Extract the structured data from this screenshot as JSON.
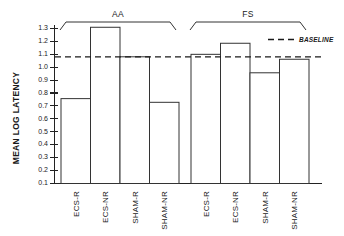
{
  "chart_data": {
    "type": "bar",
    "title": "",
    "xlabel": "",
    "ylabel": "MEAN LOG LATENCY",
    "ylim": [
      0.04,
      1.35
    ],
    "yticks": [
      "1.3",
      "1.2",
      "1.1",
      "1.0",
      "0.9",
      "0.8",
      "0.7",
      "0.6",
      "0.5",
      "0.4",
      "0.3",
      "0.2",
      "0.1"
    ],
    "ytick_values": [
      1.3,
      1.2,
      1.1,
      1.0,
      0.9,
      0.8,
      0.7,
      0.6,
      0.5,
      0.4,
      0.3,
      0.2,
      0.1
    ],
    "grid": false,
    "legend_position": "top-right",
    "groups": [
      {
        "name": "AA",
        "categories": [
          "ECS-R",
          "ECS-NR",
          "SHAM-R",
          "SHAM-NR"
        ],
        "values": [
          0.73,
          1.31,
          1.07,
          0.7
        ]
      },
      {
        "name": "FS",
        "categories": [
          "ECS-R",
          "ECS-NR",
          "SHAM-R",
          "SHAM-NR"
        ],
        "values": [
          1.09,
          1.18,
          0.94,
          1.05
        ]
      }
    ],
    "categories": [
      "ECS-R",
      "ECS-NR",
      "SHAM-R",
      "SHAM-NR",
      "ECS-R",
      "ECS-NR",
      "SHAM-R",
      "SHAM-NR"
    ],
    "values": [
      0.73,
      1.31,
      1.07,
      0.7,
      1.09,
      1.18,
      0.94,
      1.05
    ],
    "annotations": [
      {
        "name": "baseline",
        "label": "BASELINE",
        "value": 1.07,
        "style": "dashed-horizontal-line"
      }
    ],
    "colors": {
      "bar_fill": "#ffffff",
      "bar_stroke": "#333333",
      "axis": "#222222",
      "baseline": "#1a1a1a",
      "text": "#1a1a1a"
    }
  },
  "labels": {
    "y_axis_title": "MEAN LOG LATENCY",
    "group_aa": "AA",
    "group_fs": "FS",
    "baseline_legend": "BASELINE",
    "ytick_1_3": "1.3",
    "ytick_1_2": "1.2",
    "ytick_1_1": "1.1",
    "ytick_1_0": "1.0",
    "ytick_0_9": "0.9",
    "ytick_0_8": "0.8",
    "ytick_0_7": "0.7",
    "ytick_0_6": "0.6",
    "ytick_0_5": "0.5",
    "ytick_0_4": "0.4",
    "ytick_0_3": "0.3",
    "ytick_0_2": "0.2",
    "ytick_0_1": "0.1",
    "cat_aa_0": "ECS-R",
    "cat_aa_1": "ECS-NR",
    "cat_aa_2": "SHAM-R",
    "cat_aa_3": "SHAM-NR",
    "cat_fs_0": "ECS-R",
    "cat_fs_1": "ECS-NR",
    "cat_fs_2": "SHAM-R",
    "cat_fs_3": "SHAM-NR"
  }
}
